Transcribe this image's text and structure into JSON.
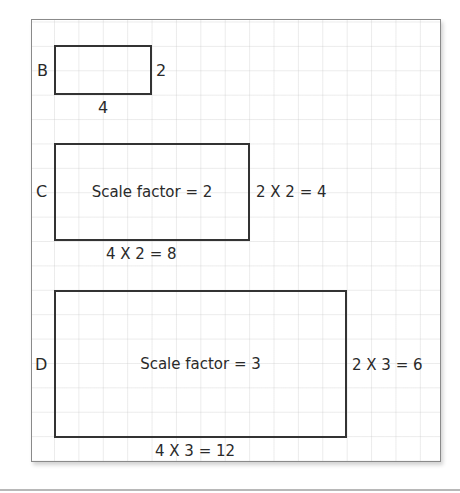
{
  "diagram": {
    "colors": {
      "outline": "#333333",
      "frame": "#8a8a8a",
      "grid": "#c8c8c8",
      "text": "#2a2a2a"
    },
    "shapes": [
      {
        "id": "B",
        "label": "B",
        "width_units": 4,
        "height_units": 2,
        "width_label": "4",
        "height_label": "2",
        "inner_text": ""
      },
      {
        "id": "C",
        "label": "C",
        "width_units": 8,
        "height_units": 4,
        "width_label": "4 X 2 = 8",
        "height_label": "2 X 2 = 4",
        "inner_text": "Scale factor = 2"
      },
      {
        "id": "D",
        "label": "D",
        "width_units": 12,
        "height_units": 6,
        "width_label": "4 X 3 = 12",
        "height_label": "2 X 3 = 6",
        "inner_text": "Scale factor = 3"
      }
    ]
  }
}
